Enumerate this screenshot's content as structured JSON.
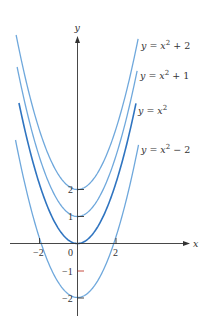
{
  "chart_data": {
    "type": "line",
    "title": "",
    "xlabel": "x",
    "ylabel": "y",
    "x_ticks": [
      -2,
      0,
      2
    ],
    "y_ticks": [
      -2,
      -1,
      1,
      2
    ],
    "x_tick_labels": [
      "−2",
      "0",
      "2"
    ],
    "y_tick_labels": [
      "−2",
      "−1",
      "1",
      "2"
    ],
    "grid": false,
    "legend_position": "inline-right",
    "series": [
      {
        "name": "y = x² + 2",
        "shift": 2,
        "color": "#6fa8dc",
        "label_base": "y = x",
        "label_sup": "2",
        "label_tail": " + 2"
      },
      {
        "name": "y = x² + 1",
        "shift": 1,
        "color": "#6fa8dc",
        "label_base": "y = x",
        "label_sup": "2",
        "label_tail": " + 1"
      },
      {
        "name": "y = x²",
        "shift": 0,
        "color": "#2f74c0",
        "label_base": "y = x",
        "label_sup": "2",
        "label_tail": ""
      },
      {
        "name": "y = x² − 2",
        "shift": -2,
        "color": "#6fa8dc",
        "label_base": "y = x",
        "label_sup": "2",
        "label_tail": " − 2"
      }
    ],
    "colors": {
      "axis": "#333333",
      "highlight_tick": "#c0392b"
    }
  }
}
